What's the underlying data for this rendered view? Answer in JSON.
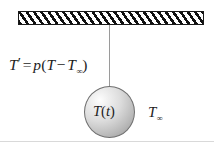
{
  "figure": {
    "background_color": "#ffffff"
  },
  "ceiling": {
    "name": "hatched-support",
    "hatch_color": "#111111",
    "fill_color": "#ffffff",
    "border_color": "#1a1a1a"
  },
  "string": {
    "name": "suspension-string",
    "color": "#9a9a9a"
  },
  "sphere": {
    "name": "body-sphere",
    "fill_light": "#fdfdfd",
    "fill_dark": "#9a9a9a",
    "border_color": "#6f6f6f",
    "label_T": "T",
    "label_open_paren": "(",
    "label_t": "t",
    "label_close_paren": ")"
  },
  "equation": {
    "lhs_T": "T",
    "lhs_prime": "′",
    "equals": "=",
    "coefficient": "p",
    "open_paren": "(",
    "inner_T": "T",
    "minus": "−",
    "ambient_T": "T",
    "ambient_sub": "∞",
    "close_paren": ")",
    "plain_text": "T′ = p(T − T∞)"
  },
  "ambient_label": {
    "name": "ambient-temperature-label",
    "symbol": "T",
    "subscript": "∞"
  }
}
